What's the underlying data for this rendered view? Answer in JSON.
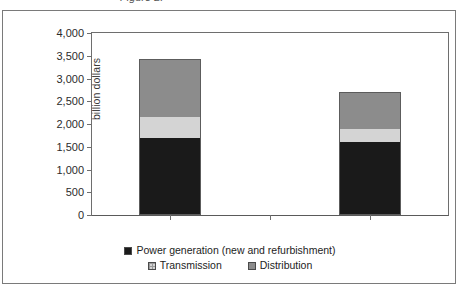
{
  "figure": {
    "cropped_title": "Figure 2.",
    "frame_color": "#7a7a7a"
  },
  "chart_data": {
    "type": "bar",
    "subtype": "stacked-column",
    "title": "",
    "xlabel": "",
    "ylabel": "billion dollars",
    "categories": [
      "Reference",
      "Alternative"
    ],
    "series": [
      {
        "name": "Power generation (new and refurbishment)",
        "color": "#1a1a1a",
        "values": [
          1700,
          1600
        ]
      },
      {
        "name": "Transmission",
        "color": "#d4d4d4",
        "values": [
          470,
          300
        ]
      },
      {
        "name": "Distribution",
        "color": "#8c8c8c",
        "values": [
          1250,
          800
        ]
      }
    ],
    "totals": [
      3420,
      2700
    ],
    "ylim": [
      0,
      4000
    ],
    "ytick_step": 500,
    "ytick_labels": [
      "4,000",
      "3,500",
      "3,000",
      "2,500",
      "2,000",
      "1,500",
      "1,000",
      "500",
      "0"
    ],
    "ytick_values": [
      4000,
      3500,
      3000,
      2500,
      2000,
      1500,
      1000,
      500,
      0
    ],
    "grid": false,
    "legend_position": "bottom"
  },
  "legend": {
    "rows": [
      [
        {
          "label": "Power generation (new and refurbishment)",
          "swatch": "dark",
          "color": "#1a1a1a"
        }
      ],
      [
        {
          "label": "Transmission",
          "swatch": "light",
          "color": "#d4d4d4"
        },
        {
          "label": "Distribution",
          "swatch": "medium",
          "color": "#8c8c8c"
        }
      ]
    ]
  }
}
